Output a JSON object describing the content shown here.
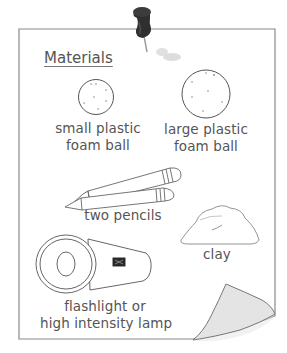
{
  "sheet": {
    "title": "Materials",
    "paper_color": "#ffffff",
    "border_color": "#8a8a8a",
    "curl_color": "#e4e4e4"
  },
  "pin": {
    "icon": "push-pin-icon",
    "color": "#2f2f2f"
  },
  "items": [
    {
      "name": "small-foam-ball",
      "label_line1": "small plastic",
      "label_line2": "foam ball"
    },
    {
      "name": "large-foam-ball",
      "label_line1": "large plastic",
      "label_line2": "foam ball"
    },
    {
      "name": "pencils",
      "label_line1": "two pencils"
    },
    {
      "name": "clay",
      "label_line1": "clay"
    },
    {
      "name": "flashlight",
      "label_line1": "flashlight or",
      "label_line2": "high intensity lamp"
    }
  ]
}
